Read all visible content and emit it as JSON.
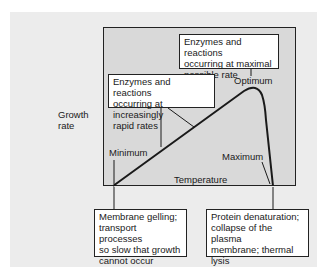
{
  "diagram": {
    "y_axis_label_line1": "Growth",
    "y_axis_label_line2": "rate",
    "x_axis_label": "Temperature",
    "points": {
      "minimum": "Minimum",
      "optimum": "Optimum",
      "maximum": "Maximum"
    },
    "annotations": {
      "optimum_box": [
        "Enzymes and reactions",
        "occurring at maximal",
        "possible rate"
      ],
      "rising_box": [
        "Enzymes and reactions",
        "occurring at increasingly",
        "rapid rates"
      ],
      "minimum_box": [
        "Membrane gelling;",
        "transport processes",
        "so slow that growth",
        "cannot occur"
      ],
      "maximum_box": [
        "Protein denaturation;",
        "collapse of the plasma",
        "membrane; thermal",
        "lysis"
      ]
    },
    "colors": {
      "panel": "#ececec",
      "plot_area": "#d9d9d9",
      "line": "#1a1a1a",
      "box_fill": "#ffffff"
    }
  }
}
